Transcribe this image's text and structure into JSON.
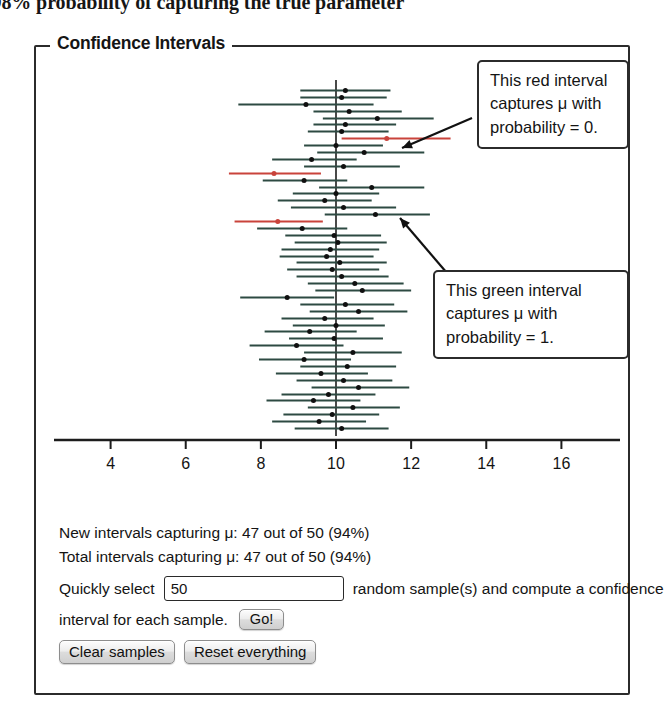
{
  "page": {
    "top_sentence": "ce interval has a 98% probability of capturing the true parameter"
  },
  "groupbox": {
    "title": "Confidence Intervals"
  },
  "callouts": {
    "red": {
      "line1": "This red interval",
      "line2": "captures μ with",
      "line3": "probability = 0."
    },
    "green": {
      "line1": "This green interval",
      "line2": "captures μ with",
      "line3": "probability = 1."
    }
  },
  "panel": {
    "stat_new": "New intervals capturing μ: 47 out of 50 (94%)",
    "stat_total": "Total intervals capturing μ: 47 out of 50 (94%)",
    "quick_prefix": "Quickly select",
    "sample_count": "50",
    "sample_placeholder": "50",
    "quick_suffix": "random sample(s) and compute a confidence",
    "interval_text": "interval for each sample.",
    "go_label": "Go!",
    "clear_label": "Clear samples",
    "reset_label": "Reset everything"
  },
  "colors": {
    "interval_normal": "#2d4a42",
    "interval_miss": "#c9433b",
    "point": "#101010",
    "axis": "#1c1c1c",
    "center_line": "#1c1c1c",
    "frame": "#2b2b2b"
  },
  "chart_data": {
    "type": "scatter",
    "title": "Confidence Intervals",
    "xlabel": "",
    "ylabel": "",
    "xlim": [
      2.6,
      17.4
    ],
    "ticks": [
      4,
      6,
      8,
      10,
      12,
      14,
      16
    ],
    "grid": false,
    "legend": null,
    "true_mu": 10,
    "n_intervals": 50,
    "captured": 47,
    "missed": 3,
    "capture_percent": "94%",
    "annotations": [
      "This red interval captures μ with probability = 0.",
      "This green interval captures μ with probability = 1."
    ],
    "series_note": "Each row is one confidence interval: [lower, estimate, upper, captures_mu]",
    "intervals": [
      [
        9.05,
        10.25,
        11.45,
        true
      ],
      [
        9.05,
        10.15,
        11.35,
        true
      ],
      [
        7.4,
        9.2,
        11.0,
        true
      ],
      [
        9.4,
        10.35,
        11.75,
        true
      ],
      [
        9.65,
        11.1,
        12.6,
        true
      ],
      [
        9.4,
        10.25,
        11.6,
        true
      ],
      [
        9.25,
        10.15,
        11.4,
        true
      ],
      [
        10.15,
        11.35,
        13.05,
        false
      ],
      [
        9.15,
        10.0,
        11.25,
        true
      ],
      [
        9.5,
        10.75,
        12.35,
        true
      ],
      [
        8.3,
        9.35,
        10.55,
        true
      ],
      [
        9.15,
        10.2,
        11.7,
        true
      ],
      [
        7.15,
        8.35,
        9.6,
        false
      ],
      [
        8.05,
        9.15,
        10.3,
        true
      ],
      [
        9.55,
        10.95,
        12.35,
        true
      ],
      [
        8.85,
        10.0,
        11.15,
        true
      ],
      [
        8.45,
        9.7,
        10.95,
        true
      ],
      [
        8.8,
        10.2,
        11.6,
        true
      ],
      [
        9.7,
        11.05,
        12.5,
        true
      ],
      [
        7.3,
        8.45,
        9.65,
        false
      ],
      [
        7.9,
        9.1,
        10.3,
        true
      ],
      [
        8.65,
        9.95,
        11.2,
        true
      ],
      [
        8.9,
        10.05,
        11.35,
        true
      ],
      [
        8.55,
        9.85,
        11.15,
        true
      ],
      [
        8.5,
        9.75,
        11.0,
        true
      ],
      [
        8.95,
        10.1,
        11.35,
        true
      ],
      [
        8.7,
        9.9,
        11.15,
        true
      ],
      [
        8.95,
        10.15,
        11.4,
        true
      ],
      [
        9.25,
        10.5,
        11.8,
        true
      ],
      [
        9.45,
        10.7,
        12.0,
        true
      ],
      [
        7.45,
        8.7,
        9.95,
        true
      ],
      [
        9.05,
        10.25,
        11.55,
        true
      ],
      [
        9.3,
        10.6,
        11.9,
        true
      ],
      [
        8.55,
        9.7,
        11.0,
        true
      ],
      [
        8.85,
        10.0,
        11.3,
        true
      ],
      [
        8.1,
        9.3,
        10.55,
        true
      ],
      [
        8.75,
        9.95,
        11.25,
        true
      ],
      [
        7.7,
        8.95,
        10.2,
        true
      ],
      [
        9.15,
        10.45,
        11.75,
        true
      ],
      [
        7.95,
        9.15,
        10.4,
        true
      ],
      [
        9.05,
        10.3,
        11.6,
        true
      ],
      [
        8.4,
        9.6,
        10.85,
        true
      ],
      [
        8.95,
        10.2,
        11.5,
        true
      ],
      [
        9.35,
        10.6,
        11.95,
        true
      ],
      [
        8.55,
        9.8,
        11.05,
        true
      ],
      [
        8.15,
        9.4,
        10.65,
        true
      ],
      [
        9.25,
        10.45,
        11.7,
        true
      ],
      [
        8.6,
        9.9,
        11.15,
        true
      ],
      [
        8.3,
        9.55,
        10.8,
        true
      ],
      [
        8.9,
        10.15,
        11.4,
        true
      ]
    ]
  }
}
